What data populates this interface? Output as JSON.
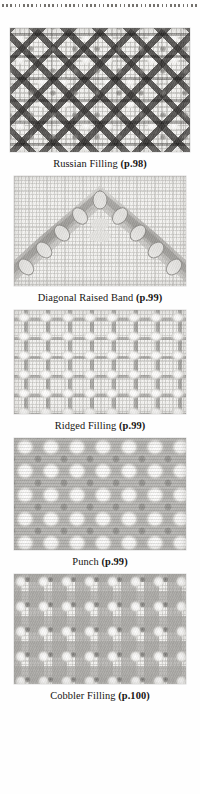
{
  "page": {
    "width_px": 200,
    "height_px": 794,
    "background_color": "#ffffff",
    "text_color": "#161412",
    "top_rule": "dotted-rule"
  },
  "figures": [
    {
      "id": "russian-filling",
      "name": "Russian Filling",
      "page_ref": "(p.98)",
      "photo": {
        "alt": "Stitched sampler: dark diagonal lattice over even-weave canvas with pale padded diamonds",
        "tone": "#6a635a",
        "ground_color": "#f3f1ea",
        "thread_color": "#3a342f",
        "width_px": 180,
        "height_px": 124
      }
    },
    {
      "id": "diagonal-raised-band",
      "name": "Diagonal Raised Band",
      "page_ref": "(p.99)",
      "photo": {
        "alt": "Stitched sampler: pale chevron / peaked raised band worked diagonally on white canvas",
        "tone": "#b5b1a8",
        "ground_color": "#f7f6f1",
        "thread_color": "#a9a59c",
        "width_px": 172,
        "height_px": 110
      }
    },
    {
      "id": "ridged-filling",
      "name": "Ridged Filling",
      "page_ref": "(p.99)",
      "photo": {
        "alt": "Stitched sampler: grid of white puffed stitch blocks divided by soft gray ridge lines",
        "tone": "#b0aca3",
        "ground_color": "#f6f4ee",
        "thread_color": "#b4b0a7",
        "width_px": 172,
        "height_px": 104
      }
    },
    {
      "id": "punch",
      "name": "Punch",
      "page_ref": "(p.99)",
      "photo": {
        "alt": "Stitched sampler: punch stitch, white square pads on gray ground with small gray diamonds between",
        "tone": "#9d9a92",
        "ground_color": "#b9b6ad",
        "thread_color": "#ffffff",
        "width_px": 172,
        "height_px": 112
      }
    },
    {
      "id": "cobbler-filling",
      "name": "Cobbler Filling",
      "page_ref": "(p.100)",
      "photo": {
        "alt": "Stitched sampler: cobbler filling, square blocks of stitches separated by light open channels",
        "tone": "#a8a49b",
        "ground_color": "#f1efe8",
        "thread_color": "#a6a298",
        "width_px": 172,
        "height_px": 110
      }
    }
  ]
}
